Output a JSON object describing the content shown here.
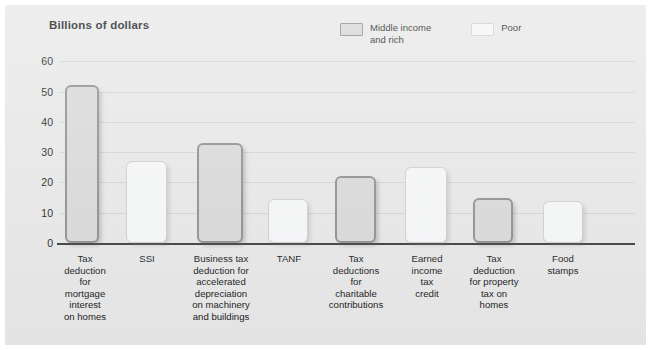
{
  "chart_data": {
    "type": "bar",
    "title": "Billions of dollars",
    "xlabel": "",
    "ylabel": "Billions of dollars",
    "ylim": [
      0,
      60
    ],
    "yticks": [
      0,
      10,
      20,
      30,
      40,
      50,
      60
    ],
    "grid": true,
    "legend_position": "top-right",
    "categories": [
      "Tax\ndeduction\nfor mortgage\ninterest\non homes",
      "SSI",
      "Business tax\ndeduction for\naccelerated\ndepreciation\non machinery\nand buildings",
      "TANF",
      "Tax\ndeductions\nfor\ncharitable\ncontributions",
      "Earned\nincome\ntax\ncredit",
      "Tax\ndeduction\nfor property\ntax on\nhomes",
      "Food\nstamps"
    ],
    "values": [
      52,
      27,
      33,
      14.5,
      22,
      25,
      15,
      14
    ],
    "point_series": [
      "Middle income and rich",
      "Poor",
      "Middle income and rich",
      "Poor",
      "Middle income and rich",
      "Poor",
      "Middle income and rich",
      "Poor"
    ],
    "series": [
      {
        "name": "Middle income and rich",
        "values": [
          52,
          null,
          33,
          null,
          22,
          null,
          15,
          null
        ]
      },
      {
        "name": "Poor",
        "values": [
          null,
          27,
          null,
          14.5,
          null,
          25,
          null,
          14
        ]
      }
    ]
  },
  "legend": {
    "items": [
      {
        "label": "Middle income\nand rich",
        "key": "rich"
      },
      {
        "label": "Poor",
        "key": "poor"
      }
    ]
  },
  "colors": {
    "panel_background": "#e8e8e8",
    "rich_fill": "#d9d9d9",
    "rich_border": "#8d8e8f",
    "poor_fill": "#f6f7f8",
    "poor_border": "#cdcecf",
    "gridline": "#d2d3d4",
    "axis": "#3a3c3e",
    "text": "#17191b"
  }
}
